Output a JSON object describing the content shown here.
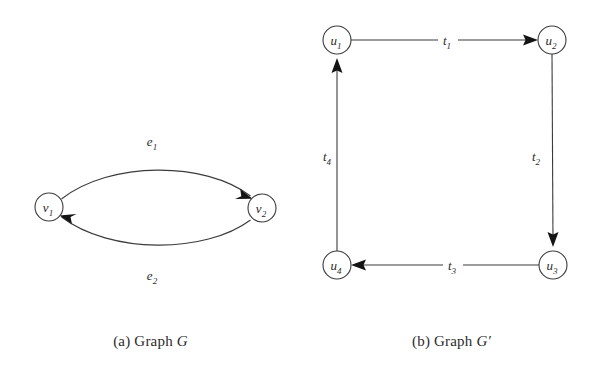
{
  "figure": {
    "background_color": "#ffffff",
    "line_color": "#3b3b3b",
    "arrow_color": "#141414",
    "text_color": "#2b2b2b"
  },
  "panel_a": {
    "caption_prefix": "(a) Graph ",
    "caption_graph_name": "G",
    "caption_full": "(a) Graph G",
    "nodes": [
      {
        "id": "v1",
        "label": "v",
        "subscript": "1",
        "cx": 49,
        "cy": 207,
        "r": 14
      },
      {
        "id": "v2",
        "label": "v",
        "subscript": "2",
        "cx": 262,
        "cy": 208,
        "r": 14
      }
    ],
    "edges": [
      {
        "id": "e1",
        "label": "e",
        "subscript": "1",
        "from": "v1",
        "to": "v2",
        "direction": "v1-to-v2",
        "curvature": "arc-up",
        "label_x": 152,
        "label_y": 146
      },
      {
        "id": "e2",
        "label": "e",
        "subscript": "2",
        "from": "v2",
        "to": "v1",
        "direction": "v2-to-v1",
        "curvature": "arc-down",
        "label_x": 152,
        "label_y": 280
      }
    ]
  },
  "panel_b": {
    "caption_prefix": "(b) Graph ",
    "caption_graph_name": "G",
    "caption_prime": "′",
    "caption_full": "(b) Graph G′",
    "nodes": [
      {
        "id": "u1",
        "label": "u",
        "subscript": "1",
        "cx": 337,
        "cy": 40,
        "r": 14
      },
      {
        "id": "u2",
        "label": "u",
        "subscript": "2",
        "cx": 552,
        "cy": 40,
        "r": 14
      },
      {
        "id": "u3",
        "label": "u",
        "subscript": "3",
        "cx": 553,
        "cy": 265,
        "r": 14
      },
      {
        "id": "u4",
        "label": "u",
        "subscript": "4",
        "cx": 337,
        "cy": 265,
        "r": 14
      }
    ],
    "edges": [
      {
        "id": "t1",
        "label": "t",
        "subscript": "1",
        "from": "u1",
        "to": "u2",
        "direction": "left-to-right",
        "label_x": 447,
        "label_y": 33
      },
      {
        "id": "t2",
        "label": "t",
        "subscript": "2",
        "from": "u2",
        "to": "u3",
        "direction": "top-to-bottom",
        "label_x": 540,
        "label_y": 157
      },
      {
        "id": "t3",
        "label": "t",
        "subscript": "3",
        "from": "u3",
        "to": "u4",
        "direction": "right-to-left",
        "label_x": 452,
        "label_y": 259
      },
      {
        "id": "t4",
        "label": "t",
        "subscript": "4",
        "from": "u4",
        "to": "u1",
        "direction": "bottom-to-top",
        "label_x": 325,
        "label_y": 157
      }
    ]
  }
}
